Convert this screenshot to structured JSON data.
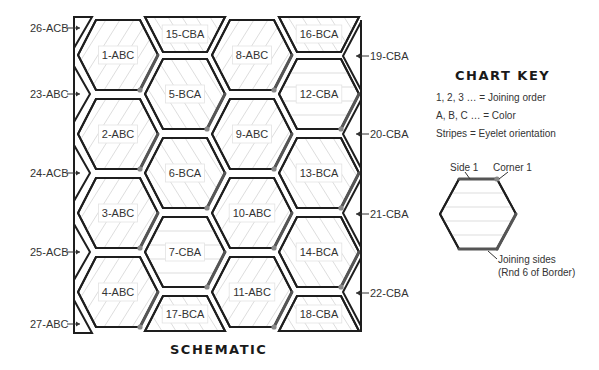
{
  "schematic": {
    "title": "SCHEMATIC",
    "hexagons": [
      {
        "id": "1-ABC",
        "col": 0,
        "row": 0,
        "stripes": "diagonal-right"
      },
      {
        "id": "2-ABC",
        "col": 0,
        "row": 1,
        "stripes": "diagonal-right"
      },
      {
        "id": "3-ABC",
        "col": 0,
        "row": 2,
        "stripes": "diagonal-right"
      },
      {
        "id": "4-ABC",
        "col": 0,
        "row": 3,
        "stripes": "diagonal-right"
      },
      {
        "id": "5-BCA",
        "col": 1,
        "row": 0,
        "stripes": "diagonal-left"
      },
      {
        "id": "6-BCA",
        "col": 1,
        "row": 1,
        "stripes": "diagonal-left"
      },
      {
        "id": "7-CBA",
        "col": 1,
        "row": 2,
        "stripes": "horizontal"
      },
      {
        "id": "8-ABC",
        "col": 2,
        "row": 0,
        "stripes": "diagonal-right"
      },
      {
        "id": "9-ABC",
        "col": 2,
        "row": 1,
        "stripes": "diagonal-right"
      },
      {
        "id": "10-ABC",
        "col": 2,
        "row": 2,
        "stripes": "diagonal-right"
      },
      {
        "id": "11-ABC",
        "col": 2,
        "row": 3,
        "stripes": "diagonal-right"
      },
      {
        "id": "12-CBA",
        "col": 3,
        "row": 0,
        "stripes": "horizontal"
      },
      {
        "id": "13-BCA",
        "col": 3,
        "row": 1,
        "stripes": "diagonal-left"
      },
      {
        "id": "14-BCA",
        "col": 3,
        "row": 2,
        "stripes": "diagonal-left"
      }
    ],
    "half_hexagons": [
      {
        "id": "15-CBA",
        "col": 1,
        "position": "top"
      },
      {
        "id": "16-BCA",
        "col": 3,
        "position": "top"
      },
      {
        "id": "17-BCA",
        "col": 1,
        "position": "bottom"
      },
      {
        "id": "18-CBA",
        "col": 3,
        "position": "bottom"
      }
    ],
    "left_edge_labels": [
      {
        "id": "26-ACB",
        "y": 28
      },
      {
        "id": "23-ABC",
        "y": 94
      },
      {
        "id": "24-ACB",
        "y": 173
      },
      {
        "id": "25-ACB",
        "y": 252
      },
      {
        "id": "27-ABC",
        "y": 324
      }
    ],
    "right_edge_labels": [
      {
        "id": "19-CBA",
        "y": 56
      },
      {
        "id": "20-CBA",
        "y": 134
      },
      {
        "id": "21-CBA",
        "y": 214
      },
      {
        "id": "22-CBA",
        "y": 293
      }
    ]
  },
  "chart_key": {
    "title": "CHART KEY",
    "lines": [
      "1, 2, 3 … = Joining order",
      "A, B, C … = Color",
      "Stripes = Eyelet orientation"
    ],
    "side_label": "Side 1",
    "corner_label": "Corner 1",
    "joining_label_1": "Joining sides",
    "joining_label_2": "(Rnd 6 of Border)"
  },
  "colors": {
    "outline": "#1e1e1e",
    "stripe": "#d9d9d9",
    "joining_edge": "#555555",
    "corner_dot": "#888888"
  }
}
